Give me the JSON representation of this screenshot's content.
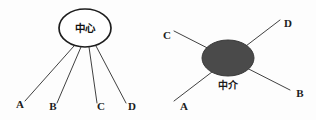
{
  "figure": {
    "background_color": "#fdfdfd",
    "width": 316,
    "height": 120,
    "diagrams": [
      {
        "id": "centralized-network",
        "name": "center-hub-diagram",
        "hub": {
          "label": "中心",
          "label_position": "inside",
          "style": "open-ellipse",
          "fill_color": "#ffffff",
          "stroke_color": "#1d1d1d",
          "cx": 85,
          "cy": 28,
          "rx": 26,
          "ry": 19
        },
        "endpoints": [
          {
            "label": "A",
            "x": 20,
            "y": 108,
            "anchor_x": 74,
            "anchor_y": 46
          },
          {
            "label": "B",
            "x": 53,
            "y": 110,
            "anchor_x": 81,
            "anchor_y": 47
          },
          {
            "label": "C",
            "x": 99,
            "y": 110,
            "anchor_x": 89,
            "anchor_y": 47
          },
          {
            "label": "D",
            "x": 129,
            "y": 110,
            "anchor_x": 96,
            "anchor_y": 46
          }
        ]
      },
      {
        "id": "brokered-network",
        "name": "broker-hub-diagram",
        "hub": {
          "label": "中介",
          "label_position": "below",
          "style": "filled-ellipse",
          "fill_color": "#4a4a4a",
          "stroke_color": "#3a3a3a",
          "cx": 228,
          "cy": 58,
          "rx": 26,
          "ry": 18
        },
        "endpoints": [
          {
            "label": "C",
            "x": 167,
            "y": 39,
            "line_x": 177,
            "line_y": 30
          },
          {
            "label": "D",
            "x": 284,
            "y": 27,
            "line_x": 278,
            "line_y": 22
          },
          {
            "label": "A",
            "x": 180,
            "y": 110,
            "line_x": 174,
            "line_y": 100
          },
          {
            "label": "B",
            "x": 296,
            "y": 97,
            "line_x": 288,
            "line_y": 89
          }
        ]
      }
    ]
  }
}
